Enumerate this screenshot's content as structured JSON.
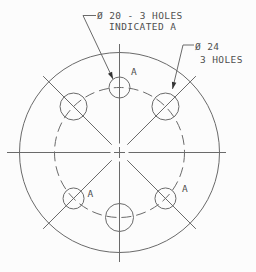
{
  "colors": {
    "background": "#fcfcfc",
    "line": "#6a6a6a",
    "text": "#4f4f4f",
    "arrow": "#333333"
  },
  "geometry": {
    "center": {
      "x": 119.5,
      "y": 152.5
    },
    "outer_radius": 100,
    "bolt_circle_radius": 65,
    "centerline": {
      "v_top": 44,
      "v_bottom": 262,
      "h_left": 7,
      "h_right": 226,
      "center_half": 5.5,
      "gap": 3.5
    },
    "radial_angles_deg": [
      45,
      135,
      225,
      315
    ],
    "radial_inner": 11,
    "radial_outer": 108,
    "holes": [
      {
        "angle_deg": 90,
        "r": 10.5,
        "size": "small"
      },
      {
        "angle_deg": 225,
        "r": 10.5,
        "size": "small"
      },
      {
        "angle_deg": 315,
        "r": 10.5,
        "size": "small"
      },
      {
        "angle_deg": 45,
        "r": 13.5,
        "size": "large"
      },
      {
        "angle_deg": 135,
        "r": 13.5,
        "size": "large"
      },
      {
        "angle_deg": 270,
        "r": 14,
        "size": "large"
      }
    ]
  },
  "hole_labels": [
    {
      "text": "A",
      "x": 131,
      "y": 75
    },
    {
      "text": "A",
      "x": 87.5,
      "y": 197
    },
    {
      "text": "A",
      "x": 182,
      "y": 192
    }
  ],
  "callouts": {
    "small_holes": {
      "line1": "Ø 20 - 3 HOLES",
      "line2": "INDICATED A",
      "tick": [
        83,
        15.5,
        96,
        15.5
      ],
      "leader": [
        83,
        15.5,
        113,
        79
      ]
    },
    "large_holes": {
      "line1": "Ø 24",
      "line2": "3 HOLES",
      "tick": [
        183,
        45,
        194,
        45
      ],
      "leader": [
        183,
        45,
        172.5,
        89
      ]
    }
  }
}
